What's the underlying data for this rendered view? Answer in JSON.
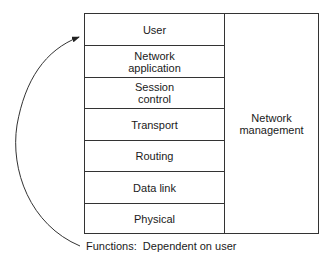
{
  "diagram": {
    "layers": [
      {
        "label": "User",
        "top": 0,
        "height": 32
      },
      {
        "label": "Network\napplication",
        "top": 32,
        "height": 32
      },
      {
        "label": "Session\ncontrol",
        "top": 64,
        "height": 31
      },
      {
        "label": "Transport",
        "top": 95,
        "height": 32
      },
      {
        "label": "Routing",
        "top": 127,
        "height": 31
      },
      {
        "label": "Data link",
        "top": 158,
        "height": 32
      },
      {
        "label": "Physical",
        "top": 190,
        "height": 31
      }
    ],
    "side_box": {
      "label": "Network\nmanagement"
    },
    "caption": "Functions:  Dependent on user",
    "arrow": {
      "description": "curved arrow from caption up to User layer",
      "color": "#333333"
    }
  }
}
